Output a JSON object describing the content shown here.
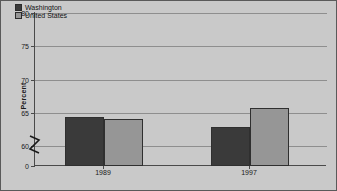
{
  "chart_data": {
    "type": "bar",
    "title": "",
    "xlabel": "",
    "ylabel": "Percent",
    "categories": [
      "1989",
      "1997"
    ],
    "series": [
      {
        "name": "Washington",
        "values": [
          64.3,
          62.8
        ],
        "color": "#3a3a3a"
      },
      {
        "name": "United States",
        "values": [
          64.0,
          65.7
        ],
        "color": "#969696"
      }
    ],
    "ylim": [
      0,
      80
    ],
    "yticks": [
      0,
      60,
      65,
      70,
      75,
      80
    ],
    "ytick_labels": [
      "0",
      "60",
      "65",
      "70",
      "75",
      "80"
    ],
    "axis_break": true,
    "axis_break_between": [
      0,
      60
    ],
    "grid": true,
    "legend_position": "top-left",
    "plot_background": "#c9c9c9",
    "gridline_color": "#8e8e8e",
    "axis_color": "#4a4a4a",
    "border_color": "#5a5a5a"
  },
  "legend": {
    "items": [
      {
        "label": "Washington"
      },
      {
        "label": "United States"
      }
    ]
  },
  "axis": {
    "y_title": "Percent"
  }
}
